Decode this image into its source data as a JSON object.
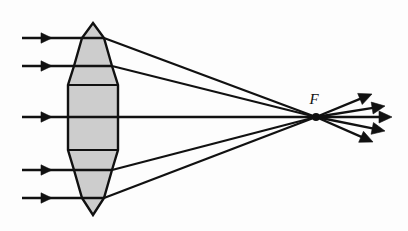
{
  "figure": {
    "background_color": "#fdfdfd",
    "stroke_color": "#111111",
    "lens_fill_color": "#cdcdcd",
    "lens_stroke_color": "#111111"
  },
  "labels": {
    "focal_point": "F"
  },
  "lens": {
    "name": "biconvex-lens",
    "axis_y": 117,
    "apex_top": {
      "x": 93,
      "y": 23
    },
    "apex_bottom": {
      "x": 93,
      "y": 215
    },
    "half_width_max": 25,
    "outline_points": "93,23 104,38 112,66 118,85 118,150 112,170 104,198 93,215 82,198 74,170 68,150 68,85 74,66 82,38",
    "facet_lines": [
      {
        "x1": 82,
        "y1": 38,
        "x2": 104,
        "y2": 38
      },
      {
        "x1": 74,
        "y1": 66,
        "x2": 112,
        "y2": 66
      },
      {
        "x1": 68,
        "y1": 85,
        "x2": 118,
        "y2": 85
      },
      {
        "x1": 68,
        "y1": 150,
        "x2": 118,
        "y2": 150
      },
      {
        "x1": 74,
        "y1": 170,
        "x2": 112,
        "y2": 170
      },
      {
        "x1": 82,
        "y1": 198,
        "x2": 104,
        "y2": 198
      }
    ]
  },
  "focal_point": {
    "name": "focal-point-F",
    "x": 316,
    "y": 117,
    "dot_radius": 4,
    "label_x": 314,
    "label_y": 104
  },
  "incoming_rays": [
    {
      "id": "ray-1",
      "y": 38,
      "start_x": 22,
      "arrow_tip_x": 52,
      "end_x": 82
    },
    {
      "id": "ray-2",
      "y": 66,
      "start_x": 22,
      "arrow_tip_x": 52,
      "end_x": 74
    },
    {
      "id": "ray-3",
      "y": 117,
      "start_x": 22,
      "arrow_tip_x": 52,
      "end_x": 68
    },
    {
      "id": "ray-4",
      "y": 170,
      "start_x": 22,
      "arrow_tip_x": 52,
      "end_x": 74
    },
    {
      "id": "ray-5",
      "y": 198,
      "start_x": 22,
      "arrow_tip_x": 52,
      "end_x": 82
    }
  ],
  "internal_rays": [
    {
      "id": "inner-1",
      "x1": 82,
      "y1": 38,
      "x2": 104,
      "y2": 38
    },
    {
      "id": "inner-2",
      "x1": 74,
      "y1": 66,
      "x2": 112,
      "y2": 66
    },
    {
      "id": "inner-3",
      "x1": 68,
      "y1": 117,
      "x2": 118,
      "y2": 117
    },
    {
      "id": "inner-4",
      "x1": 74,
      "y1": 170,
      "x2": 112,
      "y2": 170
    },
    {
      "id": "inner-5",
      "x1": 82,
      "y1": 198,
      "x2": 104,
      "y2": 198
    }
  ],
  "converging_rays": [
    {
      "id": "conv-1",
      "x1": 104,
      "y1": 38,
      "x2": 316,
      "y2": 117
    },
    {
      "id": "conv-2",
      "x1": 112,
      "y1": 66,
      "x2": 316,
      "y2": 117
    },
    {
      "id": "conv-3",
      "x1": 118,
      "y1": 117,
      "x2": 316,
      "y2": 117
    },
    {
      "id": "conv-4",
      "x1": 112,
      "y1": 170,
      "x2": 316,
      "y2": 117
    },
    {
      "id": "conv-5",
      "x1": 104,
      "y1": 198,
      "x2": 316,
      "y2": 117
    }
  ],
  "diverging_rays": [
    {
      "id": "div-1",
      "x1": 316,
      "y1": 117,
      "tip_x": 372,
      "tip_y": 94
    },
    {
      "id": "div-2",
      "x1": 316,
      "y1": 117,
      "tip_x": 385,
      "tip_y": 106
    },
    {
      "id": "div-3",
      "x1": 316,
      "y1": 117,
      "tip_x": 392,
      "tip_y": 117
    },
    {
      "id": "div-4",
      "x1": 316,
      "y1": 117,
      "tip_x": 385,
      "tip_y": 131
    },
    {
      "id": "div-5",
      "x1": 316,
      "y1": 117,
      "tip_x": 373,
      "tip_y": 142
    }
  ]
}
